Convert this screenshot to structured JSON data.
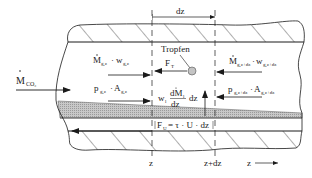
{
  "diagram": {
    "type": "control-volume sketch of annular two-phase pipe flow",
    "labels": {
      "dz_top": "dz",
      "inlet_flow": {
        "main": "M",
        "sub": "CO₂",
        "dot": true
      },
      "momentum_in": {
        "m": "M",
        "m_sub": "g,z",
        "w": "w",
        "w_sub": "g,z"
      },
      "momentum_out": {
        "m": "M",
        "m_sub": "g,z+dz",
        "w": "w",
        "w_sub": "g,z+dz"
      },
      "pressure_in": {
        "p": "p",
        "p_sub": "g,z",
        "a": "A",
        "a_sub": "g,z"
      },
      "pressure_out": {
        "p": "p",
        "p_sub": "g,z+dz",
        "a": "A",
        "a_sub": "g,z+dz"
      },
      "droplet": "Tropfen",
      "drag_force": {
        "main": "F",
        "sub": "T"
      },
      "entrainment": {
        "w": "w",
        "w_sub": "l",
        "num": "dM",
        "num_sub": "l",
        "den": "dz",
        "tail": "dz"
      },
      "wall_friction": {
        "main": "F",
        "sub": "U",
        "eq": "= τ · U · dz"
      },
      "z_left": "z",
      "z_right": "z+dz",
      "z_axis": "z"
    },
    "colors": {
      "line": "#1a1a1a",
      "film": "#bdbdbd",
      "droplet": "#c4c4c4",
      "background": "#ffffff"
    }
  }
}
